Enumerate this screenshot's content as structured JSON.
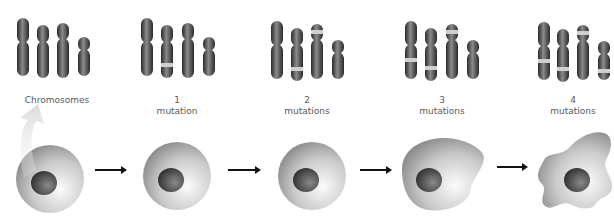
{
  "diagram": {
    "stages": [
      {
        "id": "normal",
        "label_line1": "Chromosomes",
        "label_line2": "",
        "mutations": 0,
        "cell_shape": "round"
      },
      {
        "id": "m1",
        "label_line1": "1",
        "label_line2": "mutation",
        "mutations": 1,
        "cell_shape": "round"
      },
      {
        "id": "m2",
        "label_line1": "2",
        "label_line2": "mutations",
        "mutations": 2,
        "cell_shape": "round"
      },
      {
        "id": "m3",
        "label_line1": "3",
        "label_line2": "mutations",
        "mutations": 3,
        "cell_shape": "irregular"
      },
      {
        "id": "m4",
        "label_line1": "4",
        "label_line2": "mutations",
        "mutations": 4,
        "cell_shape": "amoeboid"
      }
    ],
    "colors": {
      "chromosome": "#3a3a3a",
      "mutation_band": "#c8c8c8",
      "cell_light": "#f2f2f2",
      "cell_dark": "#8f8f8f",
      "nucleus": "#3c3c3c",
      "arrow": "#111111",
      "callout_arrow": "#e4e4e4"
    }
  }
}
